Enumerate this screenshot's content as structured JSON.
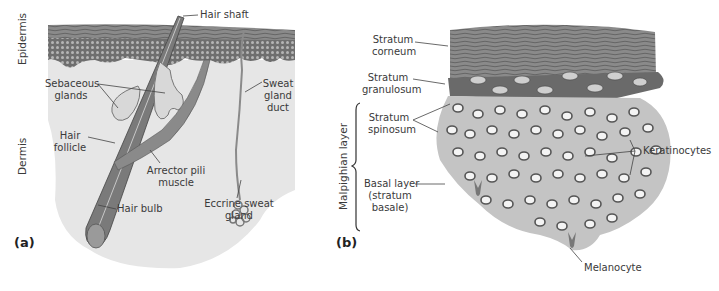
{
  "panel_a": {
    "panel_label": "(a)",
    "side_labels": {
      "epidermis": "Epidermis",
      "dermis": "Dermis"
    },
    "labels": {
      "hair_shaft": "Hair shaft",
      "sebaceous_1": "Sebaceous",
      "sebaceous_2": "glands",
      "sweat_1": "Sweat",
      "sweat_2": "gland",
      "sweat_3": "duct",
      "hair_follicle_1": "Hair",
      "hair_follicle_2": "follicle",
      "arrector_1": "Arrector pili",
      "arrector_2": "muscle",
      "hair_bulb": "Hair bulb",
      "eccrine_1": "Eccrine sweat",
      "eccrine_2": "gland"
    }
  },
  "panel_b": {
    "panel_label": "(b)",
    "side_labels": {
      "malpighian": "Malpighian layer"
    },
    "labels": {
      "corneum_1": "Stratum",
      "corneum_2": "corneum",
      "granulosum_1": "Stratum",
      "granulosum_2": "granulosum",
      "spinosum_1": "Stratum",
      "spinosum_2": "spinosum",
      "basal_1": "Basal layer",
      "basal_2": "(stratum",
      "basal_3": "basale)",
      "keratinocytes": "Keratinocytes",
      "melanocyte": "Melanocyte"
    }
  }
}
